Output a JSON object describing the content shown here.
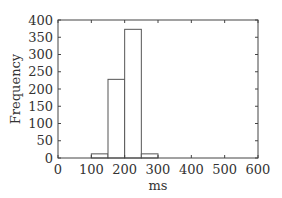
{
  "chart_data": {
    "type": "bar",
    "subtype": "histogram",
    "title": "",
    "xlabel": "ms",
    "ylabel": "Frequency",
    "xlim": [
      0,
      600
    ],
    "ylim": [
      0,
      400
    ],
    "xticks": [
      0,
      100,
      200,
      300,
      400,
      500,
      600
    ],
    "yticks": [
      0,
      50,
      100,
      150,
      200,
      250,
      300,
      350,
      400
    ],
    "bin_width": 50,
    "bins": [
      {
        "start": 100,
        "end": 150,
        "count": 12
      },
      {
        "start": 150,
        "end": 200,
        "count": 228
      },
      {
        "start": 200,
        "end": 250,
        "count": 373
      },
      {
        "start": 250,
        "end": 300,
        "count": 12
      }
    ],
    "grid": false,
    "legend": null,
    "bar_fill": "#ffffff",
    "bar_stroke": "#555555"
  }
}
